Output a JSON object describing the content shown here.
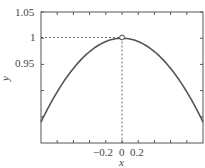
{
  "chart_data": {
    "type": "line",
    "title": "",
    "xlabel": "x",
    "ylabel": "y",
    "xlim": [
      -1,
      1
    ],
    "ylim": [
      0.8,
      1.05
    ],
    "x_ticks": [
      -0.8,
      -0.6,
      -0.4,
      -0.2,
      0,
      0.2,
      0.4,
      0.6,
      0.8
    ],
    "x_tick_labels": [
      "-0.2",
      "0",
      "0.2"
    ],
    "x_tick_labels_display": [
      "−0.2",
      "0",
      "0.2"
    ],
    "y_ticks": [
      0.85,
      0.9,
      0.95,
      1,
      1.05
    ],
    "y_tick_labels": [
      "0.95",
      "1",
      "1.05"
    ],
    "grid": false,
    "series": [
      {
        "name": "y(x)",
        "x": [
          -1,
          -0.8,
          -0.6,
          -0.4,
          -0.2,
          0,
          0.2,
          0.4,
          0.6,
          0.8,
          1
        ],
        "y": [
          0.84,
          0.898,
          0.942,
          0.974,
          0.994,
          1,
          0.994,
          0.974,
          0.942,
          0.898,
          0.84
        ],
        "color": "#555555"
      }
    ],
    "annotations": [
      {
        "type": "marker",
        "shape": "open-circle",
        "x": 0,
        "y": 1
      },
      {
        "type": "dashed-hline",
        "y": 1,
        "from_x": -1,
        "to_x": 0
      },
      {
        "type": "dashed-vline",
        "x": 0,
        "from_y": 0.8,
        "to_y": 1
      }
    ]
  },
  "labels": {
    "y_1_05": "1.05",
    "y_1": "1",
    "y_0_95": "0.95",
    "x_m0_2": "−0.2",
    "x_0": "0",
    "x_0_2": "0.2",
    "xlabel": "x",
    "ylabel": "y"
  }
}
